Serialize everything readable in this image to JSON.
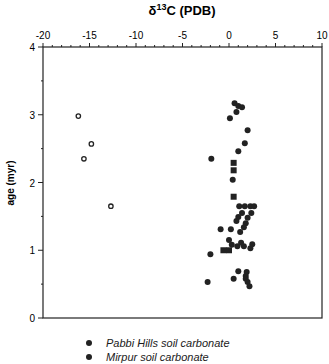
{
  "chart_data": {
    "type": "scatter",
    "title": "δ13C (PDB)",
    "xlabel": "δ13C (PDB)",
    "ylabel": "age (myr)",
    "xlim": [
      -20,
      10
    ],
    "ylim": [
      0,
      4
    ],
    "x_ticks": [
      -20,
      -15,
      -10,
      -5,
      0,
      5,
      10
    ],
    "y_ticks": [
      0,
      1,
      2,
      3,
      4
    ],
    "x_axis_position": "top",
    "grid": false,
    "legend_position": "bottom",
    "series": [
      {
        "name": "Pabbi Hills soil carbonate",
        "marker": "filled-circle",
        "points": [
          [
            0.6,
            3.17
          ],
          [
            1.0,
            3.13
          ],
          [
            1.4,
            3.11
          ],
          [
            0.8,
            3.04
          ],
          [
            0.1,
            2.95
          ],
          [
            2.0,
            2.77
          ],
          [
            1.7,
            2.58
          ],
          [
            1.0,
            2.46
          ],
          [
            -1.9,
            2.35
          ],
          [
            0.4,
            2.04
          ],
          [
            1.1,
            1.65
          ],
          [
            1.7,
            1.65
          ],
          [
            2.3,
            1.65
          ],
          [
            2.7,
            1.65
          ],
          [
            2.4,
            1.55
          ],
          [
            1.4,
            1.55
          ],
          [
            1.0,
            1.49
          ],
          [
            0.8,
            1.43
          ],
          [
            2.0,
            1.48
          ],
          [
            1.8,
            1.4
          ],
          [
            1.6,
            1.34
          ],
          [
            -0.9,
            1.31
          ],
          [
            0.2,
            1.31
          ],
          [
            1.2,
            1.27
          ],
          [
            0.0,
            1.15
          ],
          [
            0.3,
            1.08
          ],
          [
            0.9,
            1.06
          ],
          [
            1.6,
            1.06
          ],
          [
            1.3,
            1.11
          ],
          [
            2.3,
            1.03
          ],
          [
            2.5,
            1.09
          ],
          [
            -2.0,
            0.94
          ],
          [
            1.0,
            0.69
          ],
          [
            1.9,
            0.68
          ],
          [
            1.8,
            0.62
          ],
          [
            0.5,
            0.58
          ],
          [
            1.8,
            0.58
          ],
          [
            2.0,
            0.53
          ],
          [
            -2.3,
            0.53
          ],
          [
            2.2,
            0.47
          ]
        ]
      },
      {
        "name": "Mirpur soil carbonate",
        "marker": "filled-square",
        "points": [
          [
            0.5,
            2.29
          ],
          [
            0.5,
            2.18
          ],
          [
            0.5,
            1.79
          ],
          [
            -0.6,
            1.0
          ],
          [
            0.0,
            1.0
          ]
        ]
      },
      {
        "name": "open circles",
        "marker": "open-circle",
        "points": [
          [
            -16.2,
            2.98
          ],
          [
            -14.8,
            2.57
          ],
          [
            -15.6,
            2.35
          ],
          [
            -12.7,
            1.65
          ]
        ]
      }
    ]
  },
  "legend": {
    "items": [
      {
        "label": "Pabbi Hills soil carbonate"
      },
      {
        "label": "Mirpur soil carbonate"
      }
    ]
  }
}
